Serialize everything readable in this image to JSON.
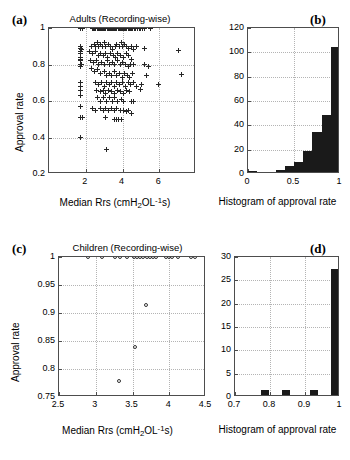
{
  "figure": {
    "panels": [
      {
        "letter": "(a)",
        "title": "Adults (Recording-wise)",
        "xlabel_parts": {
          "pre": "Median Rrs (cmH",
          "sub": "2",
          "mid": "OL",
          "sup": "-1",
          "post": "s)"
        },
        "ylabel": "Approval rate"
      },
      {
        "letter": "(b)",
        "xlabel": "Histogram of approval rate"
      },
      {
        "letter": "(c)",
        "title": "Children (Recording-wise)",
        "xlabel_parts": {
          "pre": "Median Rrs (cmH",
          "sub": "2",
          "mid": "OL",
          "sup": "-1",
          "post": "s)"
        },
        "ylabel": "Approval rate"
      },
      {
        "letter": "(d)",
        "xlabel": "Histogram of approval rate"
      }
    ]
  },
  "colors": {
    "bar_fill": "#1a1a1a",
    "marker": "#262626",
    "axis": "#4d4d4d",
    "grid": "#b4b4b4",
    "background": "#ffffff"
  },
  "chart_data": [
    {
      "id": "panel-a",
      "type": "scatter",
      "title": "Adults (Recording-wise)",
      "xlabel": "Median Rrs (cmH2OL-1s)",
      "ylabel": "Approval rate",
      "xlim": [
        0,
        8
      ],
      "ylim": [
        0.2,
        1.0
      ],
      "xticks": [
        2,
        4,
        6
      ],
      "yticks": [
        0.2,
        0.4,
        0.6,
        0.8,
        1
      ],
      "xtick_labels": [
        "2",
        "4",
        "6"
      ],
      "ytick_labels": [
        "0.2",
        "0.4",
        "0.6",
        "0.8",
        "1"
      ],
      "grid": true,
      "marker": "+",
      "points": [
        [
          1.72,
          1.0
        ],
        [
          1.84,
          1.0
        ],
        [
          2.35,
          1.0
        ],
        [
          2.42,
          1.0
        ],
        [
          2.48,
          1.0
        ],
        [
          2.55,
          1.0
        ],
        [
          2.62,
          1.0
        ],
        [
          2.68,
          1.0
        ],
        [
          2.74,
          1.0
        ],
        [
          2.8,
          1.0
        ],
        [
          2.86,
          1.0
        ],
        [
          2.92,
          1.0
        ],
        [
          2.98,
          1.0
        ],
        [
          3.04,
          1.0
        ],
        [
          3.1,
          1.0
        ],
        [
          3.16,
          1.0
        ],
        [
          3.22,
          1.0
        ],
        [
          3.28,
          1.0
        ],
        [
          3.34,
          1.0
        ],
        [
          3.4,
          1.0
        ],
        [
          3.46,
          1.0
        ],
        [
          3.52,
          1.0
        ],
        [
          3.58,
          1.0
        ],
        [
          3.64,
          1.0
        ],
        [
          3.7,
          1.0
        ],
        [
          3.76,
          1.0
        ],
        [
          3.82,
          1.0
        ],
        [
          3.88,
          1.0
        ],
        [
          3.94,
          1.0
        ],
        [
          4.0,
          1.0
        ],
        [
          4.06,
          1.0
        ],
        [
          4.12,
          1.0
        ],
        [
          4.18,
          1.0
        ],
        [
          4.24,
          1.0
        ],
        [
          4.3,
          1.0
        ],
        [
          4.36,
          1.0
        ],
        [
          4.42,
          1.0
        ],
        [
          4.48,
          1.0
        ],
        [
          4.56,
          1.0
        ],
        [
          4.64,
          1.0
        ],
        [
          4.72,
          1.0
        ],
        [
          4.8,
          1.0
        ],
        [
          4.9,
          1.0
        ],
        [
          5.0,
          1.0
        ],
        [
          5.1,
          1.0
        ],
        [
          5.22,
          1.0
        ],
        [
          5.55,
          1.0
        ],
        [
          1.7,
          0.9
        ],
        [
          1.74,
          0.89
        ],
        [
          1.78,
          0.88
        ],
        [
          1.72,
          0.87
        ],
        [
          1.7,
          0.86
        ],
        [
          1.7,
          0.84
        ],
        [
          1.72,
          0.83
        ],
        [
          1.74,
          0.82
        ],
        [
          1.7,
          0.8
        ],
        [
          1.78,
          0.8
        ],
        [
          1.7,
          0.79
        ],
        [
          1.72,
          0.7
        ],
        [
          1.7,
          0.68
        ],
        [
          1.7,
          0.66
        ],
        [
          1.72,
          0.63
        ],
        [
          1.7,
          0.57
        ],
        [
          1.7,
          0.51
        ],
        [
          1.84,
          0.51
        ],
        [
          1.7,
          0.4
        ],
        [
          2.3,
          0.9
        ],
        [
          2.45,
          0.91
        ],
        [
          2.55,
          0.9
        ],
        [
          2.62,
          0.92
        ],
        [
          2.7,
          0.9
        ],
        [
          2.78,
          0.91
        ],
        [
          2.9,
          0.9
        ],
        [
          3.0,
          0.92
        ],
        [
          3.1,
          0.9
        ],
        [
          3.22,
          0.91
        ],
        [
          3.35,
          0.9
        ],
        [
          3.48,
          0.88
        ],
        [
          3.6,
          0.9
        ],
        [
          3.7,
          0.91
        ],
        [
          3.82,
          0.9
        ],
        [
          3.92,
          0.92
        ],
        [
          4.02,
          0.9
        ],
        [
          4.12,
          0.91
        ],
        [
          4.22,
          0.9
        ],
        [
          4.35,
          0.89
        ],
        [
          4.48,
          0.9
        ],
        [
          4.6,
          0.88
        ],
        [
          4.78,
          0.9
        ],
        [
          5.2,
          0.89
        ],
        [
          7.05,
          0.875
        ],
        [
          2.2,
          0.87
        ],
        [
          2.38,
          0.86
        ],
        [
          2.52,
          0.87
        ],
        [
          2.68,
          0.85
        ],
        [
          2.8,
          0.86
        ],
        [
          2.95,
          0.85
        ],
        [
          3.08,
          0.86
        ],
        [
          3.2,
          0.84
        ],
        [
          3.35,
          0.86
        ],
        [
          3.5,
          0.85
        ],
        [
          3.62,
          0.84
        ],
        [
          3.75,
          0.86
        ],
        [
          3.9,
          0.85
        ],
        [
          4.05,
          0.84
        ],
        [
          4.2,
          0.86
        ],
        [
          4.32,
          0.85
        ],
        [
          4.5,
          0.83
        ],
        [
          2.25,
          0.82
        ],
        [
          2.4,
          0.81
        ],
        [
          2.58,
          0.82
        ],
        [
          2.72,
          0.8
        ],
        [
          2.88,
          0.81
        ],
        [
          3.02,
          0.8
        ],
        [
          3.18,
          0.82
        ],
        [
          3.3,
          0.8
        ],
        [
          3.45,
          0.81
        ],
        [
          3.58,
          0.8
        ],
        [
          3.72,
          0.82
        ],
        [
          3.88,
          0.8
        ],
        [
          4.0,
          0.81
        ],
        [
          4.15,
          0.8
        ],
        [
          4.3,
          0.79
        ],
        [
          4.45,
          0.8
        ],
        [
          4.62,
          0.8
        ],
        [
          5.2,
          0.8
        ],
        [
          5.4,
          0.79
        ],
        [
          2.3,
          0.78
        ],
        [
          2.5,
          0.76
        ],
        [
          2.65,
          0.77
        ],
        [
          2.82,
          0.75
        ],
        [
          3.0,
          0.76
        ],
        [
          3.15,
          0.74
        ],
        [
          3.28,
          0.75
        ],
        [
          3.42,
          0.74
        ],
        [
          3.55,
          0.76
        ],
        [
          3.7,
          0.74
        ],
        [
          3.85,
          0.75
        ],
        [
          3.98,
          0.73
        ],
        [
          4.1,
          0.75
        ],
        [
          4.25,
          0.74
        ],
        [
          4.4,
          0.73
        ],
        [
          4.55,
          0.75
        ],
        [
          5.3,
          0.74
        ],
        [
          7.2,
          0.745
        ],
        [
          2.55,
          0.7
        ],
        [
          2.7,
          0.69
        ],
        [
          2.85,
          0.7
        ],
        [
          3.0,
          0.68
        ],
        [
          3.15,
          0.7
        ],
        [
          3.3,
          0.69
        ],
        [
          3.42,
          0.7
        ],
        [
          3.55,
          0.68
        ],
        [
          3.7,
          0.7
        ],
        [
          3.85,
          0.69
        ],
        [
          4.0,
          0.7
        ],
        [
          4.15,
          0.68
        ],
        [
          4.3,
          0.7
        ],
        [
          4.45,
          0.69
        ],
        [
          4.6,
          0.7
        ],
        [
          4.75,
          0.68
        ],
        [
          5.05,
          0.69
        ],
        [
          5.95,
          0.69
        ],
        [
          2.6,
          0.66
        ],
        [
          2.78,
          0.65
        ],
        [
          2.95,
          0.66
        ],
        [
          3.1,
          0.64
        ],
        [
          3.25,
          0.66
        ],
        [
          3.4,
          0.65
        ],
        [
          3.55,
          0.64
        ],
        [
          3.72,
          0.66
        ],
        [
          3.88,
          0.65
        ],
        [
          4.05,
          0.64
        ],
        [
          4.22,
          0.66
        ],
        [
          4.38,
          0.65
        ],
        [
          5.0,
          0.665
        ],
        [
          2.65,
          0.62
        ],
        [
          2.82,
          0.6
        ],
        [
          2.98,
          0.62
        ],
        [
          3.12,
          0.6
        ],
        [
          3.3,
          0.62
        ],
        [
          3.45,
          0.6
        ],
        [
          3.58,
          0.62
        ],
        [
          3.75,
          0.6
        ],
        [
          3.92,
          0.61
        ],
        [
          4.08,
          0.6
        ],
        [
          4.5,
          0.6
        ],
        [
          4.62,
          0.6
        ],
        [
          2.35,
          0.56
        ],
        [
          2.55,
          0.55
        ],
        [
          2.78,
          0.56
        ],
        [
          2.95,
          0.55
        ],
        [
          3.1,
          0.56
        ],
        [
          3.25,
          0.55
        ],
        [
          3.4,
          0.56
        ],
        [
          3.55,
          0.55
        ],
        [
          3.7,
          0.56
        ],
        [
          3.88,
          0.55
        ],
        [
          4.05,
          0.55
        ],
        [
          4.2,
          0.54
        ],
        [
          4.35,
          0.55
        ],
        [
          4.5,
          0.53
        ],
        [
          3.05,
          0.51
        ],
        [
          3.55,
          0.5
        ],
        [
          3.68,
          0.5
        ],
        [
          3.8,
          0.5
        ],
        [
          3.92,
          0.5
        ],
        [
          3.15,
          0.335
        ]
      ]
    },
    {
      "id": "panel-b",
      "type": "bar",
      "xlabel": "Histogram of approval rate",
      "ylabel": "",
      "xlim": [
        0,
        1
      ],
      "ylim": [
        0,
        120
      ],
      "xticks": [
        0,
        0.5,
        1
      ],
      "yticks": [
        0,
        20,
        40,
        60,
        80,
        100,
        120
      ],
      "xtick_labels": [
        "0",
        "0.5",
        "1"
      ],
      "ytick_labels": [
        "0",
        "20",
        "40",
        "60",
        "80",
        "100",
        "120"
      ],
      "grid": true,
      "bin_edges": [
        0.0,
        0.1,
        0.2,
        0.3,
        0.4,
        0.5,
        0.6,
        0.7,
        0.8,
        0.9,
        1.0
      ],
      "bin_centers": [
        0.05,
        0.15,
        0.25,
        0.35,
        0.45,
        0.55,
        0.65,
        0.75,
        0.85,
        0.95
      ],
      "values": [
        1,
        0,
        0,
        2,
        5,
        8,
        17,
        33,
        47,
        78,
        103
      ],
      "counts_note": "last two tall bars: 78 and 103"
    },
    {
      "id": "panel-c",
      "type": "scatter",
      "title": "Children (Recording-wise)",
      "xlabel": "Median Rrs (cmH2OL-1s)",
      "ylabel": "Approval rate",
      "xlim": [
        2.5,
        4.5
      ],
      "ylim": [
        0.75,
        1.0
      ],
      "xticks": [
        2.5,
        3,
        3.5,
        4,
        4.5
      ],
      "yticks": [
        0.75,
        0.8,
        0.85,
        0.9,
        0.95,
        1
      ],
      "xtick_labels": [
        "2.5",
        "3",
        "3.5",
        "4",
        "4.5"
      ],
      "ytick_labels": [
        "0.75",
        "0.8",
        "0.85",
        "0.9",
        "0.95",
        "1"
      ],
      "grid": true,
      "marker": "o",
      "points": [
        [
          2.9,
          1.0
        ],
        [
          3.08,
          1.0
        ],
        [
          3.26,
          1.0
        ],
        [
          3.33,
          1.0
        ],
        [
          3.42,
          1.0
        ],
        [
          3.52,
          1.0
        ],
        [
          3.56,
          1.0
        ],
        [
          3.6,
          1.0
        ],
        [
          3.64,
          1.0
        ],
        [
          3.7,
          1.0
        ],
        [
          3.74,
          1.0
        ],
        [
          3.78,
          1.0
        ],
        [
          3.82,
          1.0
        ],
        [
          3.95,
          1.0
        ],
        [
          4.0,
          1.0
        ],
        [
          4.04,
          1.0
        ],
        [
          4.12,
          1.0
        ],
        [
          4.3,
          1.0
        ],
        [
          4.35,
          1.0
        ],
        [
          3.68,
          0.915
        ],
        [
          3.53,
          0.84
        ],
        [
          3.32,
          0.778
        ]
      ]
    },
    {
      "id": "panel-d",
      "type": "bar",
      "xlabel": "Histogram of approval rate",
      "ylabel": "",
      "xlim": [
        0.7,
        1.0
      ],
      "ylim": [
        0,
        30
      ],
      "xticks": [
        0.7,
        0.8,
        0.9,
        1
      ],
      "yticks": [
        0,
        5,
        10,
        15,
        20,
        25,
        30
      ],
      "xtick_labels": [
        "0.7",
        "0.8",
        "0.9",
        "1"
      ],
      "ytick_labels": [
        "0",
        "5",
        "10",
        "15",
        "20",
        "25",
        "30"
      ],
      "grid": true,
      "bin_centers": [
        0.785,
        0.845,
        0.925,
        0.985
      ],
      "values": [
        1,
        1,
        1,
        27
      ]
    }
  ]
}
